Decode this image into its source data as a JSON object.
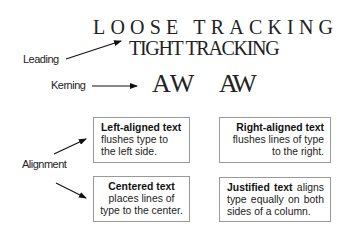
{
  "labels": {
    "leading": "Leading",
    "kerning": "Kerning",
    "alignment": "Alignment"
  },
  "samples": {
    "loose_tracking": "LOOSE TRACKING",
    "tight_tracking": "TIGHT TRACKING",
    "kerning_before": "AW",
    "kerning_after": "AW"
  },
  "boxes": [
    {
      "title": "Left-aligned text",
      "body": " flushes type to the left side.",
      "align": "left"
    },
    {
      "title": "Right-aligned text",
      "body": " flushes lines of type to the right.",
      "align": "right"
    },
    {
      "title": "Centered text",
      "body": " places lines of type to the center.",
      "align": "center"
    },
    {
      "title": "Justified text",
      "body": " aligns type equally on both sides of a column.",
      "align": "justify"
    }
  ],
  "colors": {
    "text": "#222222",
    "box_border": "#999999",
    "background": "#ffffff"
  }
}
